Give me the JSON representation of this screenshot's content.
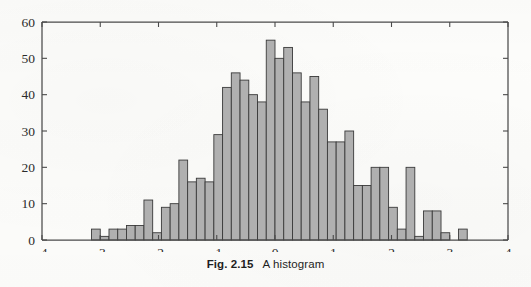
{
  "figure": {
    "caption_number": "Fig. 2.15",
    "caption_text": "A histogram"
  },
  "colors": {
    "bar_fill": "#b0b0b0",
    "bar_stroke": "#3a3a3a",
    "axis": "#4a4a4a",
    "page_background": "#fdfdfb",
    "text": "#2b2b2b"
  },
  "chart_data": {
    "type": "bar",
    "title": "",
    "subtitle": "",
    "xlabel": "",
    "ylabel": "",
    "xlim": [
      -4,
      4
    ],
    "ylim": [
      0,
      60
    ],
    "xticks": [
      -4,
      -3,
      -2,
      -1,
      0,
      1,
      2,
      3,
      4
    ],
    "xtick_labels": [
      "-4",
      "-3",
      "-2",
      "-1",
      "0",
      "1",
      "2",
      "3",
      "4"
    ],
    "yticks": [
      0,
      10,
      20,
      30,
      40,
      50,
      60
    ],
    "ytick_labels": [
      "0",
      "10",
      "20",
      "30",
      "40",
      "50",
      "60"
    ],
    "grid": false,
    "legend": null,
    "bin_width": 0.15,
    "bin_left_edges": [
      -3.15,
      -3.0,
      -2.85,
      -2.7,
      -2.55,
      -2.4,
      -2.25,
      -2.1,
      -1.95,
      -1.8,
      -1.65,
      -1.5,
      -1.35,
      -1.2,
      -1.05,
      -0.9,
      -0.75,
      -0.6,
      -0.45,
      -0.3,
      -0.15,
      0.0,
      0.15,
      0.3,
      0.45,
      0.6,
      0.75,
      0.9,
      1.05,
      1.2,
      1.35,
      1.5,
      1.65,
      1.8,
      1.95,
      2.1,
      2.25,
      2.4,
      2.55,
      2.7,
      2.85,
      3.0,
      3.15
    ],
    "bin_centers": [
      -3.075,
      -2.925,
      -2.775,
      -2.625,
      -2.475,
      -2.325,
      -2.175,
      -2.025,
      -1.875,
      -1.725,
      -1.575,
      -1.425,
      -1.275,
      -1.125,
      -0.975,
      -0.825,
      -0.675,
      -0.525,
      -0.375,
      -0.225,
      -0.075,
      0.075,
      0.225,
      0.375,
      0.525,
      0.675,
      0.825,
      0.975,
      1.125,
      1.275,
      1.425,
      1.575,
      1.725,
      1.875,
      2.025,
      2.175,
      2.325,
      2.475,
      2.625,
      2.775,
      2.925,
      3.075,
      3.225
    ],
    "values": [
      3,
      1,
      3,
      3,
      4,
      4,
      11,
      2,
      9,
      10,
      22,
      16,
      17,
      16,
      29,
      42,
      46,
      44,
      40,
      38,
      55,
      50,
      53,
      46,
      38,
      45,
      36,
      27,
      27,
      30,
      15,
      15,
      20,
      20,
      9,
      3,
      20,
      1,
      8,
      8,
      2,
      0,
      3
    ],
    "total_count": 903
  }
}
